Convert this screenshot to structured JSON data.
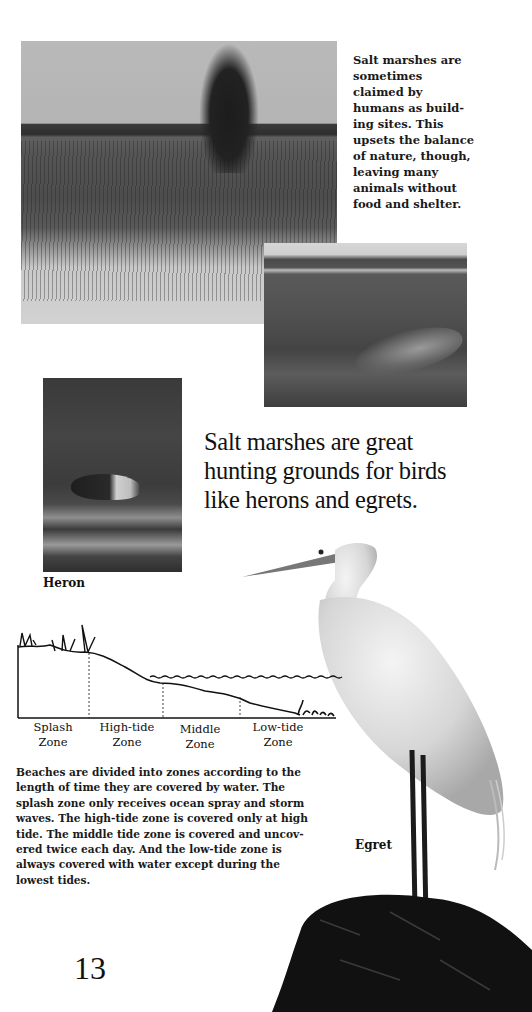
{
  "page": {
    "page_number": "13"
  },
  "photos": {
    "marsh_tree": {
      "description": "salt marsh with lone tree, reeds and sand"
    },
    "marsh_hills": {
      "description": "grassy salt marsh with hills and winding stream"
    },
    "heron": {
      "caption": "Heron"
    },
    "egret": {
      "caption": "Egret"
    }
  },
  "sidebar": {
    "lines": [
      "Salt marshes are",
      "sometimes",
      "claimed by",
      "humans as build-",
      "ing sites. This",
      "upsets the balance",
      "of nature, though,",
      "leaving many",
      "animals without",
      "food and shelter."
    ]
  },
  "pull_quote": {
    "lines": [
      "Salt marshes are great",
      "hunting grounds for birds",
      "like herons and egrets."
    ]
  },
  "diagram": {
    "zones": [
      {
        "line1": "Splash",
        "line2": "Zone"
      },
      {
        "line1": "High-tide",
        "line2": "Zone"
      },
      {
        "line1": "Middle",
        "line2": "Zone"
      },
      {
        "line1": "Low-tide",
        "line2": "Zone"
      }
    ]
  },
  "body": {
    "lines": [
      "Beaches are divided into zones according to the",
      "length of time they are covered by water. The",
      "splash zone only receives ocean spray and storm",
      "waves. The high-tide zone is covered only at high",
      "tide. The middle tide zone is covered and uncov-",
      "ered twice each day. And the low-tide zone is",
      "always covered with water except during the",
      "lowest tides."
    ]
  }
}
